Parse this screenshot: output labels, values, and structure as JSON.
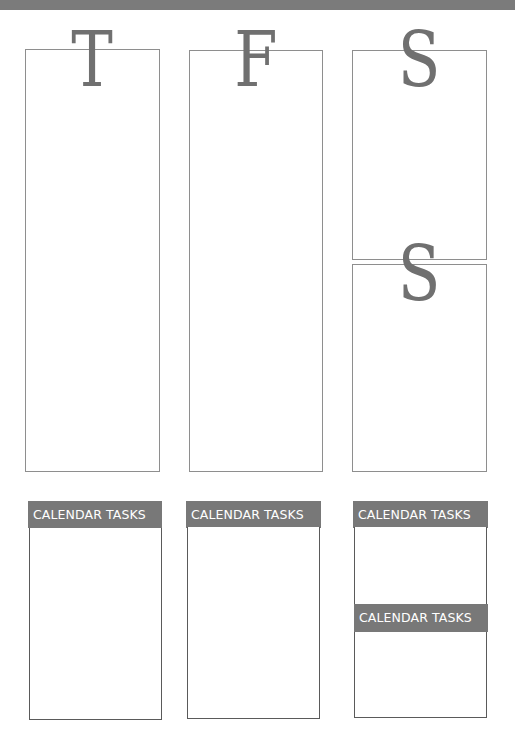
{
  "days": [
    {
      "letter": "T",
      "label": "Thursday"
    },
    {
      "letter": "F",
      "label": "Friday"
    },
    {
      "letter": "S",
      "label": "Saturday"
    },
    {
      "letter": "S",
      "label": "Sunday"
    }
  ],
  "tasks": {
    "header_label": "CALENDAR TASKS",
    "sections": [
      {
        "label": "CALENDAR TASKS"
      },
      {
        "label": "CALENDAR TASKS"
      },
      {
        "label": "CALENDAR TASKS"
      },
      {
        "label": "CALENDAR TASKS"
      }
    ]
  },
  "colors": {
    "banner": "#7b7b7b",
    "header": "#787878",
    "letter": "#707070",
    "box_border": "#8e8e8e"
  }
}
